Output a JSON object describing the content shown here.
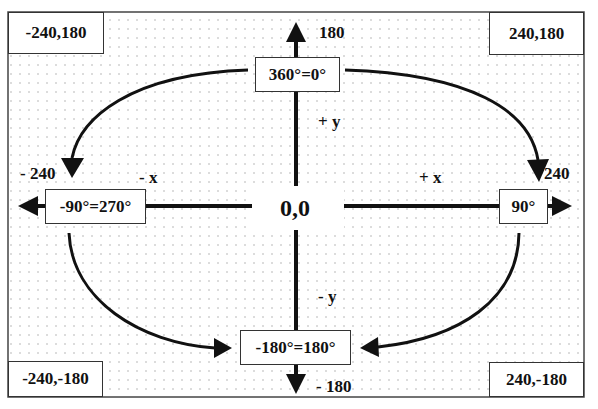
{
  "corners": {
    "top_left": "-240,180",
    "top_right": "240,180",
    "bottom_left": "-240,-180",
    "bottom_right": "240,-180"
  },
  "origin": "0,0",
  "axis_labels": {
    "y_max": "180",
    "y_min": "- 180",
    "x_min": "- 240",
    "x_max": "240",
    "plus_y": "+ y",
    "minus_y": "- y",
    "plus_x": "+ x",
    "minus_x": "- x"
  },
  "angles": {
    "top": "360°=0°",
    "right": "90°",
    "bottom": "-180°=180°",
    "left": "-90°=270°"
  },
  "colors": {
    "ink": "#111111",
    "dots": "#b0b0b0",
    "background": "#ffffff"
  }
}
